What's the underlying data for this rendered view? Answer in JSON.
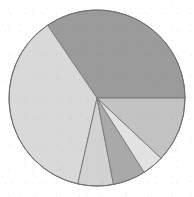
{
  "chart_data": {
    "type": "pie",
    "title": "",
    "subtitle": "",
    "xlabel": "",
    "ylabel": "",
    "legend": {
      "visible": false,
      "position": "none",
      "entries": []
    },
    "data_labels_visible": false,
    "grid": false,
    "start_angle_deg": 0,
    "direction": "counterclockwise",
    "total": 100,
    "geometry": {
      "center_x": 97,
      "center_y": 98,
      "radius": 88,
      "outline_color": "#6e6e6e",
      "outline_width": 1,
      "slice_border_color": "#7d7d7d",
      "slice_border_width": 1,
      "background_color": "#ffffff"
    },
    "categories": [
      "Segment 1",
      "Segment 2",
      "Segment 3",
      "Segment 4",
      "Segment 5",
      "Segment 6"
    ],
    "values": [
      34.5,
      37.0,
      6.5,
      6.0,
      4.0,
      12.0
    ],
    "slices": [
      {
        "name": "Segment 1",
        "value": 34.5,
        "percent": "34.5%",
        "color": "#9b9b9b",
        "start_deg": 0,
        "end_deg": 124.2
      },
      {
        "name": "Segment 2",
        "value": 37.0,
        "percent": "37.0%",
        "color": "#d9d9d9",
        "start_deg": 124.2,
        "end_deg": 257.4
      },
      {
        "name": "Segment 3",
        "value": 6.5,
        "percent": "6.5%",
        "color": "#d2d2d2",
        "start_deg": 257.4,
        "end_deg": 280.8
      },
      {
        "name": "Segment 4",
        "value": 6.0,
        "percent": "6.0%",
        "color": "#a9a9a9",
        "start_deg": 280.8,
        "end_deg": 302.4
      },
      {
        "name": "Segment 5",
        "value": 4.0,
        "percent": "4.0%",
        "color": "#e2e2e2",
        "start_deg": 302.4,
        "end_deg": 316.8
      },
      {
        "name": "Segment 6",
        "value": 12.0,
        "percent": "12.0%",
        "color": "#c3c3c3",
        "start_deg": 316.8,
        "end_deg": 360
      }
    ]
  }
}
